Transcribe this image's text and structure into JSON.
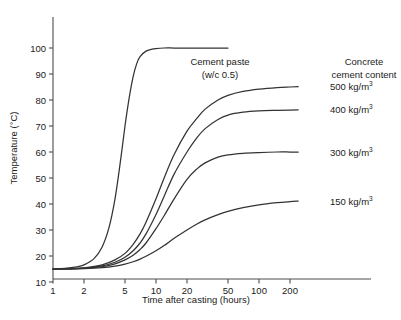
{
  "chart_data": {
    "type": "line",
    "title": "",
    "xlabel": "Time after casting (hours)",
    "ylabel": "Temperature (°C)",
    "x_scale": "log",
    "xlim": [
      1,
      300
    ],
    "ylim": [
      10,
      105
    ],
    "x_ticks": [
      1,
      2,
      5,
      10,
      20,
      50,
      100,
      200
    ],
    "x_tick_labels": [
      "1",
      "2",
      "5",
      "10",
      "20",
      "50",
      "100",
      "200"
    ],
    "y_ticks": [
      10,
      20,
      30,
      40,
      50,
      60,
      70,
      80,
      90,
      100
    ],
    "y_tick_labels": [
      "10",
      "20",
      "30",
      "40",
      "50",
      "60",
      "70",
      "80",
      "90",
      "100"
    ],
    "grid": false,
    "legend_position": "right",
    "initial_temperature": 15,
    "series": [
      {
        "name": "Cement paste (w/c 0.5)",
        "label": "Cement paste",
        "sublabel": "(w/c 0.5)",
        "plateau": 100,
        "x": [
          1,
          1.3,
          1.7,
          2,
          2.5,
          3,
          3.5,
          4,
          4.5,
          5,
          5.5,
          6,
          6.5,
          7,
          8,
          9,
          10,
          12,
          15,
          20,
          30,
          50
        ],
        "y": [
          15,
          15.2,
          15.8,
          16.6,
          19,
          23.5,
          31,
          42,
          56,
          70,
          81,
          89,
          94,
          96.7,
          98.8,
          99.5,
          99.8,
          100,
          100,
          100,
          100,
          100
        ]
      },
      {
        "name": "500 kg/m3",
        "label": "500 kg/m",
        "superscript": "3",
        "unit": "kg/m",
        "value": 500,
        "plateau": 85,
        "x": [
          1,
          1.5,
          2,
          3,
          4,
          5,
          6,
          7,
          8,
          10,
          12,
          15,
          20,
          25,
          30,
          40,
          50,
          70,
          100,
          150,
          200,
          240
        ],
        "y": [
          15,
          15.1,
          15.4,
          16.6,
          18.5,
          21,
          24.5,
          28.5,
          33,
          42,
          50,
          59,
          68,
          73,
          76.5,
          80,
          81.8,
          83.3,
          84.2,
          84.8,
          85,
          85.1
        ]
      },
      {
        "name": "400 kg/m3",
        "label": "400 kg/m",
        "superscript": "3",
        "unit": "kg/m",
        "value": 400,
        "plateau": 76,
        "x": [
          1,
          1.5,
          2,
          3,
          4,
          5,
          6,
          7,
          8,
          10,
          12,
          15,
          20,
          25,
          30,
          40,
          50,
          70,
          100,
          150,
          200,
          240
        ],
        "y": [
          15,
          15.1,
          15.3,
          16.2,
          17.6,
          19.5,
          22,
          25,
          28.5,
          36,
          43,
          51.5,
          60,
          65.5,
          69,
          72.5,
          74.2,
          75.3,
          75.8,
          76,
          76.1,
          76.2
        ]
      },
      {
        "name": "300 kg/m3",
        "label": "300 kg/m",
        "superscript": "3",
        "unit": "kg/m",
        "value": 300,
        "plateau": 60,
        "x": [
          1,
          1.5,
          2,
          3,
          4,
          5,
          6,
          7,
          8,
          10,
          12,
          15,
          20,
          25,
          30,
          40,
          50,
          70,
          100,
          150,
          200,
          240
        ],
        "y": [
          15,
          15.1,
          15.3,
          15.9,
          17,
          18.5,
          20.3,
          22.5,
          25,
          30.5,
          35.5,
          42,
          49.5,
          53.5,
          55.8,
          58,
          58.9,
          59.5,
          59.8,
          60,
          60,
          60
        ]
      },
      {
        "name": "150 kg/m3",
        "label": "150 kg/m",
        "superscript": "3",
        "unit": "kg/m",
        "value": 150,
        "plateau": 41,
        "x": [
          1,
          1.5,
          2,
          3,
          4,
          5,
          6,
          7,
          8,
          10,
          12,
          15,
          20,
          25,
          30,
          40,
          50,
          70,
          100,
          150,
          200,
          240
        ],
        "y": [
          15,
          15.0,
          15.1,
          15.5,
          16.1,
          16.9,
          17.8,
          18.8,
          19.9,
          22,
          24,
          26.8,
          30,
          32.3,
          33.9,
          35.9,
          37.2,
          38.6,
          39.7,
          40.5,
          40.9,
          41.1
        ]
      }
    ]
  },
  "legend": {
    "title_line1": "Concrete",
    "title_line2": "cement content",
    "items": [
      {
        "value": "500",
        "unit": "kg/m",
        "sup": "3"
      },
      {
        "value": "400",
        "unit": "kg/m",
        "sup": "3"
      },
      {
        "value": "300",
        "unit": "kg/m",
        "sup": "3"
      },
      {
        "value": "150",
        "unit": "kg/m",
        "sup": "3"
      }
    ]
  },
  "annotations": {
    "cement_paste_line1": "Cement paste",
    "cement_paste_line2": "(w/c 0.5)"
  },
  "colors": {
    "curve": "#333333",
    "axis": "#4d4d4d",
    "text": "#1a1a1a",
    "background": "#ffffff"
  }
}
